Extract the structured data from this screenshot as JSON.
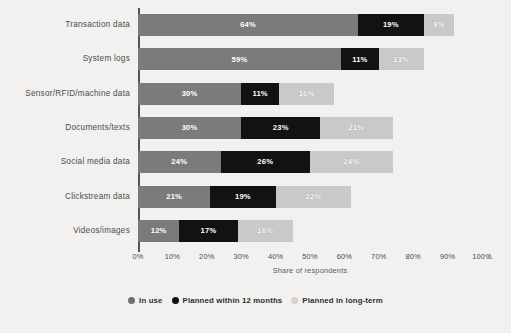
{
  "chart_data": {
    "type": "bar",
    "orientation": "horizontal",
    "stacked": true,
    "title": "",
    "subtitle": "",
    "xlabel": "Share of respondents",
    "ylabel": "",
    "xlim": [
      0,
      100
    ],
    "xticks": [
      "0%",
      "10%",
      "20%",
      "30%",
      "40%",
      "50%",
      "60%",
      "70%",
      "80%",
      "90%",
      "100%"
    ],
    "xtick_values": [
      0,
      10,
      20,
      30,
      40,
      50,
      60,
      70,
      80,
      90,
      100
    ],
    "xtick_overflow_label": "1.",
    "grid": false,
    "legend_position": "bottom",
    "categories": [
      "Transaction data",
      "System logs",
      "Sensor/RFID/machine data",
      "Documents/texts",
      "Social media data",
      "Clickstream data",
      "Videos/images"
    ],
    "series": [
      {
        "name": "In use",
        "color": "#7b7b7b",
        "values": [
          64,
          59,
          30,
          30,
          24,
          21,
          12
        ],
        "labels": [
          "64%",
          "59%",
          "30%",
          "30%",
          "24%",
          "21%",
          "12%"
        ]
      },
      {
        "name": "Planned within 12 months",
        "color": "#121212",
        "values": [
          19,
          11,
          11,
          23,
          26,
          19,
          17
        ],
        "labels": [
          "19%",
          "11%",
          "11%",
          "23%",
          "26%",
          "19%",
          "17%"
        ]
      },
      {
        "name": "Planned in long-term",
        "color": "#c9c9c9",
        "values": [
          9,
          13,
          16,
          21,
          24,
          22,
          16
        ],
        "labels": [
          "9%",
          "13%",
          "16%",
          "21%",
          "24%",
          "22%",
          "16%"
        ]
      }
    ]
  },
  "legend": {
    "items": [
      {
        "label": "In use",
        "swatch": "circle-swatch-in-use"
      },
      {
        "label": "Planned within 12 months",
        "swatch": "circle-swatch-planned-12-months"
      },
      {
        "label": "Planned in long-term",
        "swatch": "circle-swatch-planned-long-term"
      }
    ]
  },
  "axis": {
    "x_title": "Share of respondents"
  },
  "colors": {
    "in_use": "#7b7b7b",
    "planned_12": "#121212",
    "planned_long": "#c9c9c9",
    "background": "#f2f1f0",
    "axis": "#3a3a3a"
  }
}
